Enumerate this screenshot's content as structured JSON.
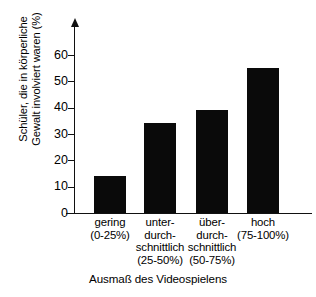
{
  "chart_data": {
    "type": "bar",
    "title": "",
    "subtitle": "",
    "xlabel": "Ausmaß des Videospielens",
    "ylabel": "Schüler, die in körperliche Gewalt involviert waren (%)",
    "ylabel_lines": [
      "Schüler, die in körperliche",
      "Gewalt involviert waren (%)"
    ],
    "categories": [
      "gering (0-25%)",
      "unter-durchschnittlich (25-50%)",
      "über-durchschnittlich (50-75%)",
      "hoch (75-100%)"
    ],
    "category_label_lines": [
      [
        "gering",
        "(0-25%)"
      ],
      [
        "unter-",
        "durch-",
        "schnittlich",
        "(25-50%)"
      ],
      [
        "über-",
        "durch-",
        "schnittlich",
        "(50-75%)"
      ],
      [
        "hoch",
        "(75-100%)"
      ]
    ],
    "values": [
      14,
      34,
      39,
      55
    ],
    "ytick_labels": [
      "0",
      "10",
      "20",
      "30",
      "40",
      "50",
      "60"
    ],
    "ytick_values": [
      0,
      10,
      20,
      30,
      40,
      50,
      60
    ],
    "ylim": [
      0,
      72
    ],
    "xlim_note": "categorical",
    "grid": false,
    "legend": "none",
    "bar_color": "#0a0a0a",
    "axis_color": "#111111",
    "background_color": "#ffffff",
    "y_axis_has_arrow": true
  }
}
